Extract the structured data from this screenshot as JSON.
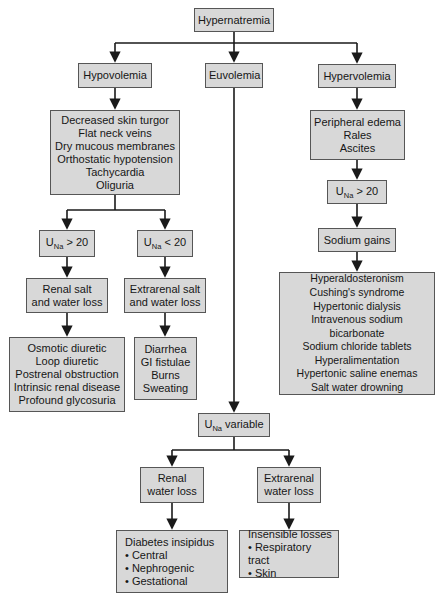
{
  "colors": {
    "background": "#ffffff",
    "box_fill": "#d8d8d8",
    "box_border": "#565656",
    "line": "#1a1a1a",
    "text": "#161616"
  },
  "nodes": {
    "root": {
      "label": "Hypernatremia"
    },
    "hypovolemia": {
      "label": "Hypovolemia"
    },
    "euvolemia": {
      "label": "Euvolemia"
    },
    "hypervolemia": {
      "label": "Hypervolemia"
    },
    "hypovolemia_signs": {
      "lines": [
        "Decreased skin turgor",
        "Flat neck veins",
        "Dry mucous membranes",
        "Orthostatic hypotension",
        "Tachycardia",
        "Oliguria"
      ]
    },
    "una_gt20_left": {
      "base": "U",
      "sub": "Na",
      "rest": " > 20"
    },
    "una_lt20": {
      "base": "U",
      "sub": "Na",
      "rest": " < 20"
    },
    "renal_salt_loss": {
      "lines": [
        "Renal salt",
        "and water loss"
      ]
    },
    "extrarenal_salt_loss": {
      "lines": [
        "Extrarenal salt",
        "and water loss"
      ]
    },
    "renal_salt_causes": {
      "lines": [
        "Osmotic diuretic",
        "Loop diuretic",
        "Postrenal obstruction",
        "Intrinsic renal disease",
        "Profound glycosuria"
      ]
    },
    "extrarenal_salt_causes": {
      "lines": [
        "Diarrhea",
        "GI fistulae",
        "Burns",
        "Sweating"
      ]
    },
    "hypervolemia_signs": {
      "lines": [
        "Peripheral edema",
        "Rales",
        "Ascites"
      ]
    },
    "una_gt20_right": {
      "base": "U",
      "sub": "Na",
      "rest": " > 20"
    },
    "sodium_gains": {
      "label": "Sodium gains"
    },
    "sodium_gain_causes": {
      "lines": [
        "Hyperaldosteronism",
        "Cushing's syndrome",
        "Hypertonic dialysis",
        "Intravenous sodium bicarbonate",
        "Sodium chloride tablets",
        "Hyperalimentation",
        "Hypertonic saline enemas",
        "Salt water drowning"
      ]
    },
    "una_variable": {
      "base": "U",
      "sub": "Na",
      "rest": " variable"
    },
    "renal_water_loss": {
      "lines": [
        "Renal",
        "water loss"
      ]
    },
    "extrarenal_water_loss": {
      "lines": [
        "Extrarenal",
        "water loss"
      ]
    },
    "renal_water_causes": {
      "lines": [
        "Diabetes insipidus",
        "• Central",
        "• Nephrogenic",
        "• Gestational"
      ]
    },
    "extrarenal_water_causes": {
      "lines": [
        "Insensible losses",
        "• Respiratory tract",
        "• Skin"
      ]
    }
  }
}
